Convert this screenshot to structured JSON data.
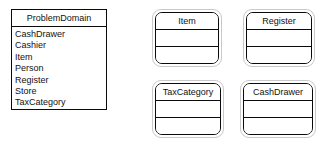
{
  "diagram": {
    "type": "uml-class-diagram",
    "background_color": "#ffffff",
    "line_color": "#0a0a0a",
    "outline_color": "#c9c9c9",
    "text_color": "#111111"
  },
  "package": {
    "title": "ProblemDomain",
    "classes": [
      "CashDrawer",
      "Cashier",
      "Item",
      "Person",
      "Register",
      "Store",
      "TaxCategory"
    ]
  },
  "class_boxes": [
    {
      "name": "Item",
      "attributes": "",
      "operations": ""
    },
    {
      "name": "Register",
      "attributes": "",
      "operations": ""
    },
    {
      "name": "TaxCategory",
      "attributes": "",
      "operations": ""
    },
    {
      "name": "CashDrawer",
      "attributes": "",
      "operations": ""
    }
  ]
}
